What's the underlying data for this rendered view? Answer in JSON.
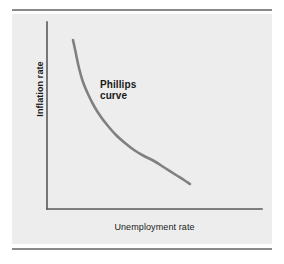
{
  "chart_data": {
    "type": "line",
    "title": "",
    "xlabel": "Unemployment rate",
    "ylabel": "Inflation rate",
    "annotations": [
      {
        "text": "Phillips\ncurve",
        "x": 100,
        "y": 79
      }
    ],
    "legend": [],
    "grid": false,
    "axes": {
      "x_ticks": [],
      "y_ticks": [],
      "xlim": [
        0,
        1
      ],
      "ylim": [
        0,
        1
      ],
      "show_x_axis": true,
      "show_y_axis": true
    },
    "series": [
      {
        "name": "Phillips curve",
        "color": "#808080",
        "width": 2.6,
        "x": [
          0.121,
          0.14,
          0.163,
          0.191,
          0.223,
          0.26,
          0.302,
          0.349,
          0.4,
          0.456,
          0.516,
          0.581,
          0.651,
          0.726,
          0.805,
          0.888,
          0.965,
          1.0
        ],
        "y": [
          1.0,
          0.905,
          0.806,
          0.709,
          0.62,
          0.537,
          0.463,
          0.397,
          0.339,
          0.289,
          0.246,
          0.209,
          0.177,
          0.15,
          0.126,
          0.105,
          0.09,
          0.085
        ],
        "path_points": [
          [
            73,
            40
          ],
          [
            76,
            54
          ],
          [
            79,
            68
          ],
          [
            83,
            82
          ],
          [
            88,
            94
          ],
          [
            94,
            106
          ],
          [
            101,
            117
          ],
          [
            108,
            126
          ],
          [
            116,
            135
          ],
          [
            125,
            143
          ],
          [
            134,
            150
          ],
          [
            144,
            156
          ],
          [
            154,
            161
          ],
          [
            165,
            168
          ],
          [
            176,
            175
          ],
          [
            184,
            180
          ],
          [
            190,
            184
          ]
        ]
      }
    ],
    "geometry": {
      "origin": [
        47,
        209
      ],
      "x_axis_end": [
        262,
        209
      ],
      "y_axis_top": [
        47,
        22
      ],
      "axis_color": "#595959",
      "axis_width": 1.6,
      "panel_color": "#ededed",
      "rule_color": "#8a8a8a",
      "background": "#ffffff"
    }
  },
  "figure": {
    "curve_label": "Phillips\ncurve",
    "x_axis_label": "Unemployment rate",
    "y_axis_label": "Inflation rate"
  }
}
